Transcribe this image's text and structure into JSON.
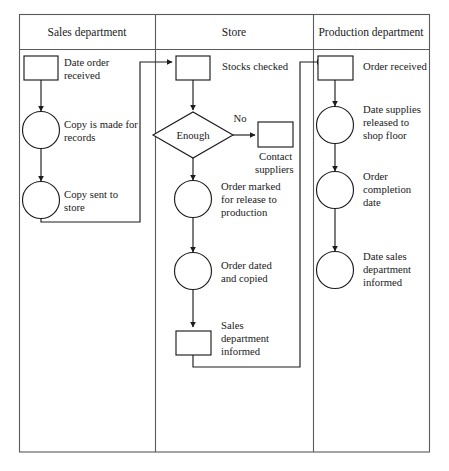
{
  "diagram": {
    "columns": [
      {
        "id": "sales",
        "label": "Sales department"
      },
      {
        "id": "store",
        "label": "Store"
      },
      {
        "id": "production",
        "label": "Production department"
      }
    ],
    "nodes": [
      {
        "id": "date-order-received",
        "column": "sales",
        "shape": "rectangle",
        "label": "Date order received",
        "label_position": "right"
      },
      {
        "id": "copy-is-made-for-records",
        "column": "sales",
        "shape": "circle",
        "label": "Copy is made for records",
        "label_position": "right"
      },
      {
        "id": "copy-sent-to-store",
        "column": "sales",
        "shape": "circle",
        "label": "Copy sent to store",
        "label_position": "right"
      },
      {
        "id": "stocks-checked",
        "column": "store",
        "shape": "rectangle",
        "label": "Stocks checked",
        "label_position": "right"
      },
      {
        "id": "enough",
        "column": "store",
        "shape": "diamond",
        "label": "Enough",
        "label_position": "inside"
      },
      {
        "id": "contact-suppliers",
        "column": "store",
        "shape": "rectangle",
        "label": "Contact suppliers",
        "label_position": "below"
      },
      {
        "id": "order-marked-for-release",
        "column": "store",
        "shape": "circle",
        "label": "Order marked for release to production",
        "label_position": "right"
      },
      {
        "id": "order-dated-and-copied",
        "column": "store",
        "shape": "circle",
        "label": "Order dated and copied",
        "label_position": "right"
      },
      {
        "id": "sales-department-informed",
        "column": "store",
        "shape": "rectangle",
        "label": "Sales department informed",
        "label_position": "right"
      },
      {
        "id": "order-received",
        "column": "production",
        "shape": "rectangle",
        "label": "Order received",
        "label_position": "right"
      },
      {
        "id": "date-supplies-released",
        "column": "production",
        "shape": "circle",
        "label": "Date supplies released to shop floor",
        "label_position": "right"
      },
      {
        "id": "order-completion-date",
        "column": "production",
        "shape": "circle",
        "label": "Order completion date",
        "label_position": "right"
      },
      {
        "id": "date-sales-dept-informed",
        "column": "production",
        "shape": "circle",
        "label": "Date sales department informed",
        "label_position": "right"
      }
    ],
    "edges": [
      {
        "from": "date-order-received",
        "to": "copy-is-made-for-records",
        "label": ""
      },
      {
        "from": "copy-is-made-for-records",
        "to": "copy-sent-to-store",
        "label": ""
      },
      {
        "from": "copy-sent-to-store",
        "to": "stocks-checked",
        "label": ""
      },
      {
        "from": "stocks-checked",
        "to": "enough",
        "label": ""
      },
      {
        "from": "enough",
        "to": "contact-suppliers",
        "label": "No"
      },
      {
        "from": "enough",
        "to": "order-marked-for-release",
        "label": ""
      },
      {
        "from": "order-marked-for-release",
        "to": "order-dated-and-copied",
        "label": ""
      },
      {
        "from": "order-dated-and-copied",
        "to": "sales-department-informed",
        "label": ""
      },
      {
        "from": "sales-department-informed",
        "to": "order-received",
        "label": ""
      },
      {
        "from": "order-received",
        "to": "date-supplies-released",
        "label": ""
      },
      {
        "from": "date-supplies-released",
        "to": "order-completion-date",
        "label": ""
      },
      {
        "from": "order-completion-date",
        "to": "date-sales-dept-informed",
        "label": ""
      }
    ],
    "labels": {
      "date_order_received_l1": "Date order",
      "date_order_received_l2": "received",
      "copy_is_made_l1": "Copy is made for",
      "copy_is_made_l2": "records",
      "copy_sent_l1": "Copy sent to",
      "copy_sent_l2": "store",
      "stocks_checked_l1": "Stocks checked",
      "enough": "Enough",
      "no_branch": "No",
      "contact_suppliers_l1": "Contact",
      "contact_suppliers_l2": "suppliers",
      "order_marked_l1": "Order marked",
      "order_marked_l2": "for release to",
      "order_marked_l3": "production",
      "order_dated_l1": "Order dated",
      "order_dated_l2": "and copied",
      "sales_dept_informed_l1": "Sales",
      "sales_dept_informed_l2": "department",
      "sales_dept_informed_l3": "informed",
      "order_received_l1": "Order received",
      "date_supplies_l1": "Date supplies",
      "date_supplies_l2": "released to",
      "date_supplies_l3": "shop floor",
      "order_completion_l1": "Order",
      "order_completion_l2": "completion",
      "order_completion_l3": "date",
      "date_sales_informed_l1": "Date sales",
      "date_sales_informed_l2": "department",
      "date_sales_informed_l3": "informed"
    },
    "colors": {
      "shape_stroke": "#1c1c1c",
      "frame_stroke": "#5a5a5a",
      "text": "#1a1a1a",
      "background": "#ffffff"
    }
  }
}
